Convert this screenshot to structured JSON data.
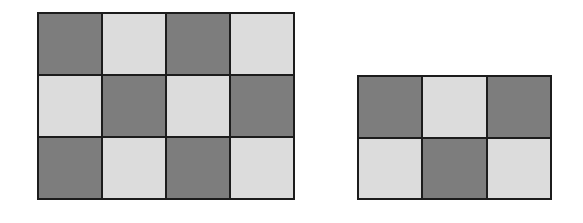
{
  "figure": {
    "colors": {
      "dark": "#7d7d7d",
      "light": "#dcdcdc",
      "border": "#1c1c1c"
    },
    "grids": [
      {
        "name": "left-grid",
        "rows": 3,
        "cols": 4,
        "box": {
          "x": 37,
          "y": 12,
          "w": 258,
          "h": 188
        },
        "pattern": [
          [
            "dark",
            "light",
            "dark",
            "light"
          ],
          [
            "light",
            "dark",
            "light",
            "dark"
          ],
          [
            "dark",
            "light",
            "dark",
            "light"
          ]
        ]
      },
      {
        "name": "right-grid",
        "rows": 2,
        "cols": 3,
        "box": {
          "x": 357,
          "y": 75,
          "w": 195,
          "h": 125
        },
        "pattern": [
          [
            "dark",
            "light",
            "dark"
          ],
          [
            "light",
            "dark",
            "light"
          ]
        ]
      }
    ]
  }
}
